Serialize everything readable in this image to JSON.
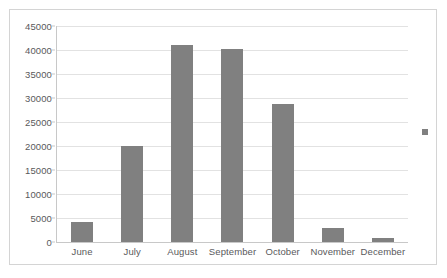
{
  "chart_data": {
    "type": "bar",
    "title": "",
    "subtitle": "",
    "xlabel": "",
    "ylabel": "",
    "categories": [
      "June",
      "July",
      "August",
      "September",
      "October",
      "November",
      "December"
    ],
    "values": [
      4100,
      20000,
      41000,
      40200,
      28800,
      2900,
      900
    ],
    "series": [
      {
        "name": "",
        "color": "#808080",
        "values": [
          4100,
          20000,
          41000,
          40200,
          28800,
          2900,
          900
        ]
      }
    ],
    "ylim": [
      0,
      45000
    ],
    "y_ticks": [
      0,
      5000,
      10000,
      15000,
      20000,
      25000,
      30000,
      35000,
      40000,
      45000
    ],
    "y_tick_labels": [
      "0",
      "5000",
      "10000",
      "15000",
      "20000",
      "25000",
      "30000",
      "35000",
      "40000",
      "45000"
    ],
    "grid": true,
    "grid_axis": "y",
    "legend": true,
    "legend_position": "right",
    "legend_entries": [
      {
        "label": "",
        "marker": "square",
        "color": "#808080"
      }
    ],
    "annotations": []
  },
  "style": {
    "bar_color": "#808080",
    "gridline_color": "#e2e2e2",
    "axis_color": "#c8c8c8",
    "border_color": "#d4d4d4",
    "text_color": "#59595b",
    "background": "#ffffff"
  }
}
